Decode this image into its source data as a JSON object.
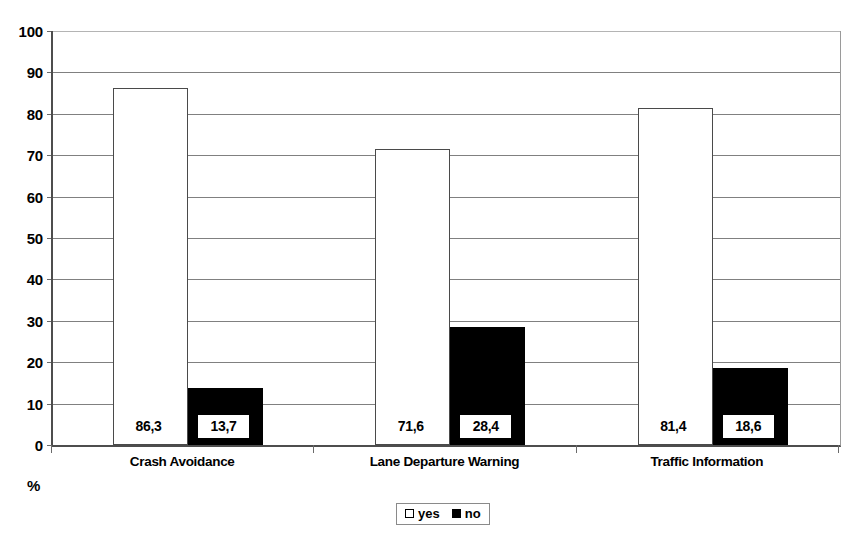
{
  "chart_data": {
    "type": "bar",
    "title": "",
    "subtitle": "",
    "xlabel": "",
    "ylabel": "%",
    "ylim": [
      0,
      100
    ],
    "ytick_step": 10,
    "ytick_labels": [
      "0",
      "10",
      "20",
      "30",
      "40",
      "50",
      "60",
      "70",
      "80",
      "90",
      "100"
    ],
    "grid": true,
    "grid_axis": "y",
    "legend_position": "bottom-center",
    "categories": [
      "Crash Avoidance",
      "Lane Departure Warning",
      "Traffic Information"
    ],
    "series": [
      {
        "name": "yes",
        "color": "#ffffff",
        "border_color": "#4a4a4a",
        "values": [
          86.3,
          71.6,
          81.4
        ],
        "labels": [
          "86,3",
          "71,6",
          "81,4"
        ]
      },
      {
        "name": "no",
        "color": "#000000",
        "border_color": "#000000",
        "values": [
          13.7,
          28.4,
          18.6
        ],
        "labels": [
          "13,7",
          "28,4",
          "18,6"
        ]
      }
    ]
  },
  "legend": {
    "entries": [
      {
        "label": "yes",
        "swatch": "white-square-icon"
      },
      {
        "label": "no",
        "swatch": "black-square-icon"
      }
    ]
  },
  "axis": {
    "unit_label": "%"
  }
}
